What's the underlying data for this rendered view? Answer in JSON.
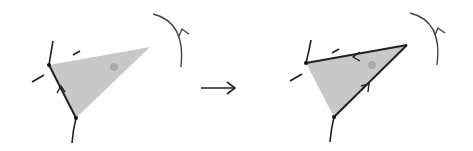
{
  "diagram": {
    "colors": {
      "stroke": "#222222",
      "fill": "#c8c8c8",
      "dot": "#a9a9a9",
      "arc": "#444444"
    },
    "panels": [
      {
        "id": "before",
        "triangle": {
          "a": [
            49,
            65
          ],
          "b": [
            150,
            47
          ],
          "c": [
            76,
            118
          ]
        },
        "dark_edges": [
          "a-c"
        ],
        "edge_arrows": [
          {
            "edge": "c-a",
            "at": [
              61,
              89
            ]
          }
        ],
        "dot": [
          114,
          67
        ],
        "rotation_arc": {
          "from": [
            153,
            14
          ],
          "to": [
            181,
            67
          ],
          "direction": "counterclockwise"
        }
      },
      {
        "id": "after",
        "triangle": {
          "a": [
            306,
            63
          ],
          "b": [
            407,
            45
          ],
          "c": [
            334,
            117
          ]
        },
        "dark_edges": [
          "a-b",
          "b-c"
        ],
        "edge_arrows": [
          {
            "edge": "b-a",
            "at": [
              355,
              56
            ]
          },
          {
            "edge": "c-b",
            "at": [
              367,
              87
            ]
          }
        ],
        "dot": [
          372,
          65
        ],
        "rotation_arc": {
          "from": [
            410,
            13
          ],
          "to": [
            437,
            65
          ],
          "direction": "counterclockwise"
        }
      }
    ],
    "transition_arrow": {
      "from": [
        201,
        88
      ],
      "to": [
        235,
        88
      ]
    }
  }
}
